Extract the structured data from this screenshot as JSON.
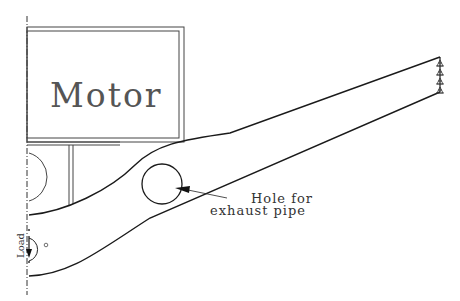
{
  "diagram": {
    "type": "mechanical-bracket-sketch",
    "labels": {
      "motor": "Motor",
      "hole_line1": "Hole for",
      "hole_line2": "exhaust pipe",
      "load": "Load"
    },
    "colors": {
      "line": "#1a1a1a",
      "text": "#333333",
      "background": "#ffffff"
    },
    "elements": [
      {
        "name": "motor-block",
        "shape": "double-rectangle"
      },
      {
        "name": "bracket-arm",
        "shape": "tapered-arm"
      },
      {
        "name": "exhaust-hole",
        "shape": "circle"
      },
      {
        "name": "fixed-supports",
        "shape": "support-symbols",
        "count": 4
      },
      {
        "name": "symmetry-axis",
        "shape": "dash-dot-line"
      },
      {
        "name": "load-arrow",
        "shape": "arrow-with-arc"
      }
    ]
  }
}
